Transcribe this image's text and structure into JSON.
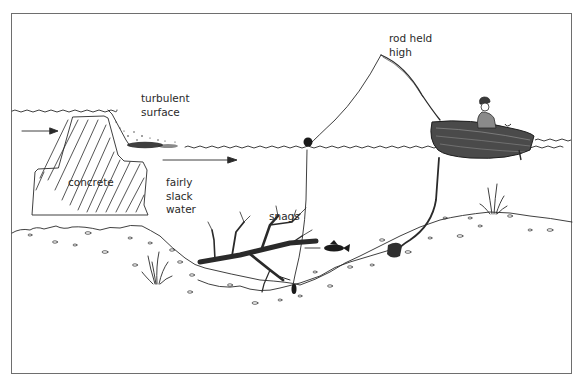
{
  "diagram": {
    "labels": {
      "turbulent": "turbulent\nsurface",
      "rod": "rod held\nhigh",
      "concrete": "concrete",
      "slack": "fairly\nslack\nwater",
      "snags": "snags"
    },
    "elements": [
      "concrete-weir",
      "water-surface",
      "turbulent-surface",
      "flow-arrow-upstream",
      "flow-arrow-downstream",
      "riverbed",
      "snags",
      "float",
      "fishing-line",
      "fish",
      "boat",
      "angler",
      "fishing-rod",
      "anchor-rope",
      "anchor-weight",
      "weed-left",
      "weed-right"
    ],
    "colors": {
      "ink": "#2a2a2a",
      "frame": "#6e6e6e",
      "background": "#ffffff"
    }
  }
}
